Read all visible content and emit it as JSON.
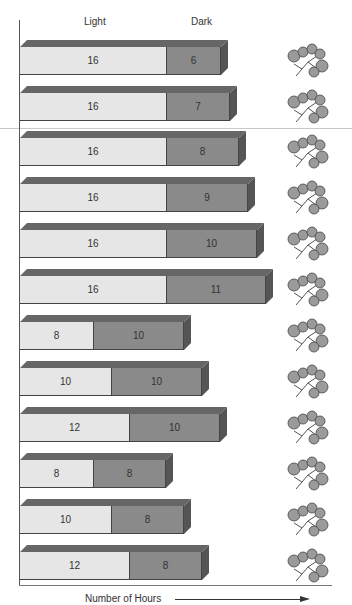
{
  "chart_data": {
    "type": "bar",
    "orientation": "horizontal",
    "stacked": true,
    "style": "3d",
    "title": "",
    "xlabel": "Number of Hours",
    "ylabel": "",
    "legend": [
      "Light",
      "Dark"
    ],
    "legend_position": "top (column headers)",
    "grid": false,
    "categories": [
      "1",
      "2",
      "3",
      "4",
      "5",
      "6",
      "7",
      "8",
      "9",
      "10",
      "11",
      "12"
    ],
    "series": [
      {
        "name": "Light",
        "values": [
          16,
          16,
          16,
          16,
          16,
          16,
          8,
          10,
          12,
          8,
          10,
          12
        ],
        "color": "#e6e6e6"
      },
      {
        "name": "Dark",
        "values": [
          6,
          7,
          8,
          9,
          10,
          11,
          10,
          10,
          10,
          8,
          8,
          8
        ],
        "color": "#8a8a8a"
      }
    ],
    "annotations": [
      "plant illustration at right of each bar"
    ]
  },
  "headers": {
    "light": "Light",
    "dark": "Dark"
  },
  "axis": {
    "x_label": "Number of Hours"
  },
  "rows": [
    {
      "light": "16",
      "dark": "6"
    },
    {
      "light": "16",
      "dark": "7"
    },
    {
      "light": "16",
      "dark": "8"
    },
    {
      "light": "16",
      "dark": "9"
    },
    {
      "light": "16",
      "dark": "10"
    },
    {
      "light": "16",
      "dark": "11"
    },
    {
      "light": "8",
      "dark": "10"
    },
    {
      "light": "10",
      "dark": "10"
    },
    {
      "light": "12",
      "dark": "10"
    },
    {
      "light": "8",
      "dark": "8"
    },
    {
      "light": "10",
      "dark": "8"
    },
    {
      "light": "12",
      "dark": "8"
    }
  ],
  "colors": {
    "light": "#e6e6e6",
    "dark": "#8a8a8a",
    "top": "#666666",
    "side": "#555555"
  },
  "icons": {
    "plant": "plant-icon"
  }
}
